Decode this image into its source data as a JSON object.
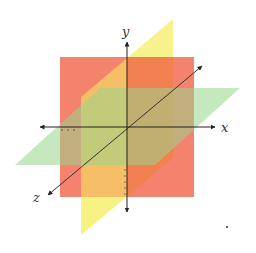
{
  "axes": {
    "x": {
      "label": "x"
    },
    "y": {
      "label": "y"
    },
    "z": {
      "label": "z"
    }
  },
  "planes": [
    {
      "name": "xy-plane",
      "color": "#f26b4f"
    },
    {
      "name": "yz-plane",
      "color": "#f7f07a"
    },
    {
      "name": "xz-plane",
      "color": "#a9dc9c"
    }
  ],
  "colors": {
    "axis": "#222222",
    "background": "#ffffff"
  }
}
